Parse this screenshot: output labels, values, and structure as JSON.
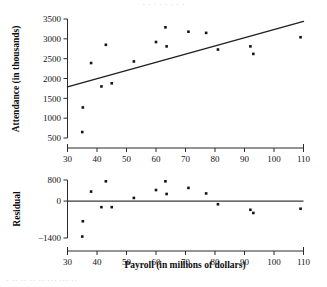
{
  "page": {
    "top_cropped_text": "· · ·  ·  · ·   · ·",
    "bottom_cropped_text": "· ·· ·· ·· ·· ··· ··· ··"
  },
  "figure": {
    "name": "payroll-attendance-regression-figure",
    "background": "#ffffff",
    "ink_color": "#141414"
  },
  "chart_data": [
    {
      "id": "scatter-with-fit",
      "type": "scatter",
      "title": "",
      "xlabel": "",
      "ylabel": "Attendance (in thousands)",
      "xlim": [
        30,
        110
      ],
      "ylim": [
        500,
        3500
      ],
      "xticks": [
        30,
        40,
        50,
        60,
        70,
        80,
        90,
        100,
        110
      ],
      "yticks": [
        500,
        1000,
        1500,
        2000,
        2500,
        3000,
        3500
      ],
      "grid": false,
      "legend": "none",
      "x": [
        35.0,
        35.2,
        38.0,
        41.5,
        43.0,
        45.0,
        52.5,
        60.0,
        63.2,
        63.6,
        71.0,
        77.0,
        81.0,
        92.0,
        93.0,
        109.0
      ],
      "y": [
        650,
        1270,
        2390,
        1800,
        2850,
        1880,
        2430,
        2920,
        3290,
        2810,
        3180,
        3150,
        2730,
        2810,
        2620,
        3040
      ],
      "fit_line": {
        "type": "line",
        "label": "least-squares regression line",
        "x": [
          30,
          110
        ],
        "y": [
          1790,
          3440
        ],
        "slope": 20.6,
        "intercept": 1172
      }
    },
    {
      "id": "residual-plot",
      "type": "scatter",
      "title": "",
      "xlabel": "Payroll (in millions of dollars)",
      "ylabel": "Residual",
      "xlim": [
        30,
        110
      ],
      "ylim": [
        -1400,
        800
      ],
      "xticks": [
        30,
        40,
        50,
        60,
        70,
        80,
        90,
        100,
        110
      ],
      "yticks": [
        800,
        0,
        -1400
      ],
      "grid": false,
      "legend": "none",
      "x": [
        35.0,
        35.2,
        38.0,
        41.5,
        43.0,
        45.0,
        52.5,
        60.0,
        63.2,
        63.6,
        71.0,
        77.0,
        81.0,
        92.0,
        93.0,
        109.0
      ],
      "y": [
        -1345,
        -765,
        360,
        -230,
        750,
        -230,
        120,
        420,
        750,
        270,
        500,
        290,
        -120,
        -330,
        -450,
        -290
      ],
      "zero_line": {
        "type": "line",
        "y": 0,
        "x": [
          30,
          110
        ]
      }
    }
  ],
  "labels": {
    "x_axis_title": "Payroll (in millions of dollars)",
    "top_y_axis_title": "Attendance (in thousands)",
    "bottom_y_axis_title": "Residual",
    "x_tick_labels": [
      "30",
      "40",
      "50",
      "60",
      "70",
      "80",
      "90",
      "100",
      "110"
    ],
    "top_y_tick_labels": [
      "3500",
      "3000",
      "2500",
      "2000",
      "1500",
      "1000",
      "500"
    ],
    "bottom_y_tick_labels": [
      "800",
      "0",
      "−1400"
    ]
  }
}
